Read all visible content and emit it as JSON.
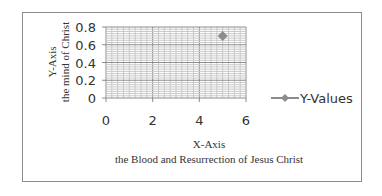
{
  "chart_data": {
    "type": "line",
    "title": "",
    "series": [
      {
        "name": "Y-Values",
        "x": [
          5
        ],
        "values": [
          0.7
        ],
        "color": "#8c8c8c",
        "marker": "diamond"
      }
    ],
    "xlabel": "X-Axis\nthe Blood and Resurrection of Jesus Christ",
    "ylabel": "Y-Axis\nthe mind of Christ",
    "xlim": [
      0,
      6
    ],
    "ylim": [
      0,
      0.8
    ],
    "x_ticks": [
      "0",
      "2",
      "4",
      "6"
    ],
    "y_ticks": [
      "0",
      "0.2",
      "0.4",
      "0.6",
      "0.8"
    ],
    "grid": true,
    "legend_position": "right"
  },
  "axes": {
    "x_title_line1": "X-Axis",
    "x_title_line2": "the Blood and Resurrection of Jesus Christ",
    "y_title_line1": "Y-Axis",
    "y_title_line2": "the mind of Christ"
  },
  "legend": {
    "label": "Y-Values"
  }
}
